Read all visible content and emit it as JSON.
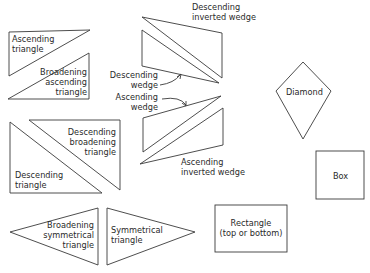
{
  "diagram": {
    "stroke_color": "#3a3a3a",
    "shapes": [
      {
        "id": "ascending-triangle",
        "label": "Ascending\ntriangle"
      },
      {
        "id": "broadening-ascending-triangle",
        "label": "Broadening\nascending\ntriangle"
      },
      {
        "id": "descending-inverted-wedge",
        "label": "Descending\ninverted wedge"
      },
      {
        "id": "descending-wedge",
        "label": "Descending\nwedge"
      },
      {
        "id": "ascending-wedge",
        "label": "Ascending\nwedge"
      },
      {
        "id": "ascending-inverted-wedge",
        "label": "Ascending\ninverted wedge"
      },
      {
        "id": "diamond",
        "label": "Diamond"
      },
      {
        "id": "descending-broadening-triangle",
        "label": "Descending\nbroadening\ntriangle"
      },
      {
        "id": "descending-triangle",
        "label": "Descending\ntriangle"
      },
      {
        "id": "box",
        "label": "Box"
      },
      {
        "id": "broadening-symmetrical-triangle",
        "label": "Broadening\nsymmetrical\ntriangle"
      },
      {
        "id": "symmetrical-triangle",
        "label": "Symmetrical\ntriangle"
      },
      {
        "id": "rectangle",
        "label": "Rectangle\n(top or bottom)"
      }
    ]
  }
}
